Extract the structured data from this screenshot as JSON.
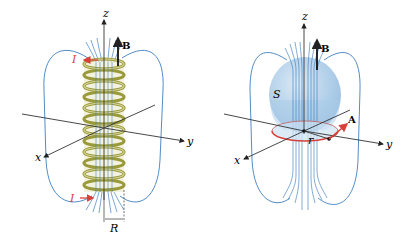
{
  "figure": {
    "left_panel": {
      "name": "solenoid",
      "labels": {
        "z_axis": "z",
        "x_axis": "x",
        "y_axis": "y",
        "field": "B",
        "current_top": "I",
        "current_bottom": "I",
        "radius": "R"
      }
    },
    "right_panel": {
      "name": "surface-and-loop",
      "labels": {
        "z_axis": "z",
        "x_axis": "x",
        "y_axis": "y",
        "field": "B",
        "surface": "S",
        "vector_potential": "A",
        "radius": "r"
      }
    },
    "colors": {
      "field_lines": "#3f7fc0",
      "coil": "#9a9a3a",
      "coil_light": "#d6d49a",
      "current_arrow": "#d8403a",
      "sphere_fill": "#a9cbe8",
      "loop": "#d8403a",
      "axes": "#333333"
    }
  }
}
